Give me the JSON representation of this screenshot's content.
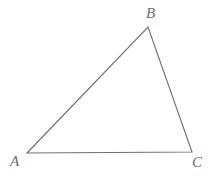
{
  "figure": {
    "kind": "geometry-diagram",
    "shape": "triangle",
    "background_color": "#ffffff",
    "stroke_color": "#6e6e6e",
    "label_color": "#6e6e6e",
    "stroke_width": 1,
    "canvas": {
      "width": 216,
      "height": 179
    },
    "vertices": [
      {
        "name": "A",
        "label": "A",
        "x": 27,
        "y": 153,
        "label_x": 16,
        "label_y": 162
      },
      {
        "name": "B",
        "label": "B",
        "x": 148,
        "y": 27,
        "label_x": 151,
        "label_y": 14
      },
      {
        "name": "C",
        "label": "C",
        "x": 192,
        "y": 152,
        "label_x": 197,
        "label_y": 163
      }
    ],
    "edges": [
      {
        "name": "AB",
        "from": "A",
        "to": "B"
      },
      {
        "name": "BC",
        "from": "B",
        "to": "C"
      },
      {
        "name": "CA",
        "from": "C",
        "to": "A"
      }
    ],
    "path": "M 27 153 L 148 27 L 192 152 Z"
  }
}
